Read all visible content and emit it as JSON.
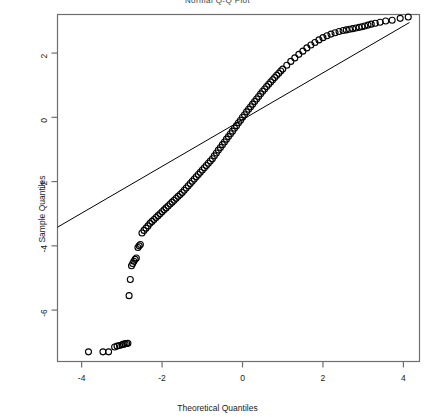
{
  "chart_data": {
    "type": "scatter",
    "title": "Normal Q-Q Plot",
    "xlabel": "Theoretical Quantiles",
    "ylabel": "Sample Quantiles",
    "xlim": [
      -4.6,
      4.4
    ],
    "ylim": [
      -7.6,
      3.2
    ],
    "xticks": [
      -4,
      -2,
      0,
      2,
      4
    ],
    "yticks": [
      2,
      0,
      -2,
      -4,
      -6
    ],
    "xticklabels": [
      "-4",
      "-2",
      "0",
      "2",
      "4"
    ],
    "yticklabels": [
      "2",
      "0",
      "-2",
      "-4",
      "-6"
    ],
    "grid": false,
    "legend": null,
    "marker": "open-circle",
    "marker_size": 3,
    "reference_line": {
      "name": "qqline",
      "x": [
        -4.6,
        4.15
      ],
      "y": [
        -3.42,
        2.95
      ],
      "color": "#000000"
    },
    "series": [
      {
        "name": "Sample Quantiles",
        "color": "#000000",
        "points": [
          [
            -3.83,
            -7.3
          ],
          [
            -3.47,
            -7.3
          ],
          [
            -3.33,
            -7.3
          ],
          [
            -3.18,
            -7.15
          ],
          [
            -3.12,
            -7.12
          ],
          [
            -3.06,
            -7.1
          ],
          [
            -3.0,
            -7.08
          ],
          [
            -2.96,
            -7.06
          ],
          [
            -2.92,
            -7.05
          ],
          [
            -2.88,
            -7.04
          ],
          [
            -2.85,
            -7.03
          ],
          [
            -2.82,
            -5.55
          ],
          [
            -2.79,
            -5.05
          ],
          [
            -2.76,
            -4.62
          ],
          [
            -2.73,
            -4.55
          ],
          [
            -2.7,
            -4.48
          ],
          [
            -2.67,
            -4.42
          ],
          [
            -2.64,
            -4.38
          ],
          [
            -2.6,
            -4.05
          ],
          [
            -2.57,
            -4.0
          ],
          [
            -2.54,
            -3.96
          ],
          [
            -2.5,
            -3.6
          ],
          [
            -2.45,
            -3.52
          ],
          [
            -2.4,
            -3.45
          ],
          [
            -2.35,
            -3.38
          ],
          [
            -2.3,
            -3.3
          ],
          [
            -2.25,
            -3.24
          ],
          [
            -2.2,
            -3.18
          ],
          [
            -2.15,
            -3.12
          ],
          [
            -2.1,
            -3.06
          ],
          [
            -2.05,
            -3.0
          ],
          [
            -2.0,
            -2.94
          ],
          [
            -1.95,
            -2.88
          ],
          [
            -1.9,
            -2.82
          ],
          [
            -1.85,
            -2.76
          ],
          [
            -1.8,
            -2.7
          ],
          [
            -1.75,
            -2.64
          ],
          [
            -1.7,
            -2.58
          ],
          [
            -1.65,
            -2.52
          ],
          [
            -1.6,
            -2.46
          ],
          [
            -1.55,
            -2.4
          ],
          [
            -1.5,
            -2.34
          ],
          [
            -1.45,
            -2.27
          ],
          [
            -1.4,
            -2.2
          ],
          [
            -1.35,
            -2.13
          ],
          [
            -1.3,
            -2.06
          ],
          [
            -1.25,
            -1.99
          ],
          [
            -1.2,
            -1.92
          ],
          [
            -1.15,
            -1.85
          ],
          [
            -1.1,
            -1.78
          ],
          [
            -1.05,
            -1.71
          ],
          [
            -1.0,
            -1.64
          ],
          [
            -0.95,
            -1.57
          ],
          [
            -0.9,
            -1.5
          ],
          [
            -0.85,
            -1.43
          ],
          [
            -0.8,
            -1.36
          ],
          [
            -0.75,
            -1.29
          ],
          [
            -0.7,
            -1.2
          ],
          [
            -0.65,
            -1.11
          ],
          [
            -0.6,
            -1.02
          ],
          [
            -0.55,
            -0.94
          ],
          [
            -0.5,
            -0.85
          ],
          [
            -0.45,
            -0.77
          ],
          [
            -0.4,
            -0.68
          ],
          [
            -0.35,
            -0.6
          ],
          [
            -0.3,
            -0.51
          ],
          [
            -0.25,
            -0.43
          ],
          [
            -0.2,
            -0.34
          ],
          [
            -0.15,
            -0.26
          ],
          [
            -0.1,
            -0.17
          ],
          [
            -0.05,
            -0.09
          ],
          [
            0.0,
            0.0
          ],
          [
            0.05,
            0.08
          ],
          [
            0.1,
            0.17
          ],
          [
            0.15,
            0.25
          ],
          [
            0.2,
            0.33
          ],
          [
            0.25,
            0.41
          ],
          [
            0.3,
            0.49
          ],
          [
            0.35,
            0.57
          ],
          [
            0.4,
            0.65
          ],
          [
            0.45,
            0.73
          ],
          [
            0.5,
            0.81
          ],
          [
            0.55,
            0.88
          ],
          [
            0.6,
            0.96
          ],
          [
            0.65,
            1.03
          ],
          [
            0.7,
            1.1
          ],
          [
            0.75,
            1.17
          ],
          [
            0.8,
            1.24
          ],
          [
            0.85,
            1.31
          ],
          [
            0.9,
            1.37
          ],
          [
            0.95,
            1.44
          ],
          [
            1.0,
            1.5
          ],
          [
            1.1,
            1.62
          ],
          [
            1.2,
            1.74
          ],
          [
            1.3,
            1.85
          ],
          [
            1.4,
            1.96
          ],
          [
            1.5,
            2.06
          ],
          [
            1.6,
            2.16
          ],
          [
            1.7,
            2.25
          ],
          [
            1.8,
            2.33
          ],
          [
            1.9,
            2.41
          ],
          [
            2.0,
            2.48
          ],
          [
            2.1,
            2.54
          ],
          [
            2.2,
            2.59
          ],
          [
            2.3,
            2.63
          ],
          [
            2.4,
            2.67
          ],
          [
            2.5,
            2.7
          ],
          [
            2.58,
            2.72
          ],
          [
            2.66,
            2.74
          ],
          [
            2.74,
            2.76
          ],
          [
            2.82,
            2.78
          ],
          [
            2.9,
            2.8
          ],
          [
            2.97,
            2.82
          ],
          [
            3.04,
            2.84
          ],
          [
            3.12,
            2.87
          ],
          [
            3.2,
            2.9
          ],
          [
            3.3,
            2.93
          ],
          [
            3.42,
            2.96
          ],
          [
            3.56,
            3.0
          ],
          [
            3.72,
            3.02
          ],
          [
            3.92,
            3.08
          ],
          [
            4.12,
            3.12
          ]
        ]
      }
    ]
  }
}
